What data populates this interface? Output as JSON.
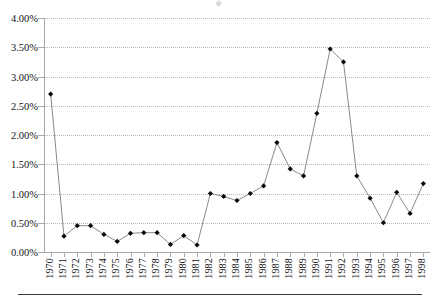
{
  "chart_data": {
    "type": "line",
    "title": "",
    "subtitle": "",
    "xlabel": "",
    "ylabel": "",
    "ylim": [
      0,
      4
    ],
    "y_tick_step": 0.5,
    "y_tick_labels": [
      "0.00%",
      "0.50%",
      "1.00%",
      "1.50%",
      "2.00%",
      "2.50%",
      "3.00%",
      "3.50%",
      "4.00%"
    ],
    "y_tick_values": [
      0,
      0.5,
      1.0,
      1.5,
      2.0,
      2.5,
      3.0,
      3.5,
      4.0
    ],
    "grid": true,
    "grid_axis": "y",
    "grid_style": "dotted",
    "legend": "none",
    "units": "percent",
    "categories": [
      "1970",
      "1971",
      "1972",
      "1973",
      "1974",
      "1975",
      "1976",
      "1977",
      "1978",
      "1979",
      "1980",
      "1981",
      "1982",
      "1983",
      "1984",
      "1985",
      "1986",
      "1987",
      "1988",
      "1989",
      "1990",
      "1991",
      "1992",
      "1993",
      "1994",
      "1995",
      "1996",
      "1997",
      "1998"
    ],
    "x_tick_labels": [
      "1970",
      "1971",
      "1972",
      "1973",
      "1974",
      "1975",
      "1976",
      "1977",
      "1978",
      "1979",
      "1980",
      "1981",
      "1982",
      "1983",
      "1984",
      "1985",
      "1986",
      "1987",
      "1988",
      "1989",
      "1990",
      "1991",
      "1992",
      "1993",
      "1994",
      "1995",
      "1996",
      "1997",
      "1998"
    ],
    "x_tick_rotation": 90,
    "values": [
      2.7,
      0.27,
      0.45,
      0.45,
      0.3,
      0.18,
      0.32,
      0.33,
      0.33,
      0.13,
      0.28,
      0.12,
      1.0,
      0.95,
      0.88,
      1.0,
      1.13,
      1.87,
      1.42,
      1.3,
      2.37,
      3.47,
      3.25,
      1.3,
      0.92,
      0.5,
      1.02,
      0.66,
      1.17
    ],
    "series": [
      {
        "name": "Series 1",
        "marker": "diamond",
        "marker_color": "#0a0a0a",
        "line_color": "#8a8a8a",
        "values": [
          2.7,
          0.27,
          0.45,
          0.45,
          0.3,
          0.18,
          0.32,
          0.33,
          0.33,
          0.13,
          0.28,
          0.12,
          1.0,
          0.95,
          0.88,
          1.0,
          1.13,
          1.87,
          1.42,
          1.3,
          2.37,
          3.47,
          3.25,
          1.3,
          0.92,
          0.5,
          1.02,
          0.66,
          1.17
        ]
      }
    ],
    "points": [
      {
        "x": "1970",
        "y": 2.7
      },
      {
        "x": "1971",
        "y": 0.27
      },
      {
        "x": "1972",
        "y": 0.45
      },
      {
        "x": "1973",
        "y": 0.45
      },
      {
        "x": "1974",
        "y": 0.3
      },
      {
        "x": "1975",
        "y": 0.18
      },
      {
        "x": "1976",
        "y": 0.32
      },
      {
        "x": "1977",
        "y": 0.33
      },
      {
        "x": "1978",
        "y": 0.33
      },
      {
        "x": "1979",
        "y": 0.13
      },
      {
        "x": "1980",
        "y": 0.28
      },
      {
        "x": "1981",
        "y": 0.12
      },
      {
        "x": "1982",
        "y": 1.0
      },
      {
        "x": "1983",
        "y": 0.95
      },
      {
        "x": "1984",
        "y": 0.88
      },
      {
        "x": "1985",
        "y": 1.0
      },
      {
        "x": "1986",
        "y": 1.13
      },
      {
        "x": "1987",
        "y": 1.87
      },
      {
        "x": "1988",
        "y": 1.42
      },
      {
        "x": "1989",
        "y": 1.3
      },
      {
        "x": "1990",
        "y": 2.37
      },
      {
        "x": "1991",
        "y": 3.47
      },
      {
        "x": "1992",
        "y": 3.25
      },
      {
        "x": "1993",
        "y": 1.3
      },
      {
        "x": "1994",
        "y": 0.92
      },
      {
        "x": "1995",
        "y": 0.5
      },
      {
        "x": "1996",
        "y": 1.02
      },
      {
        "x": "1997",
        "y": 0.66
      },
      {
        "x": "1998",
        "y": 1.17
      }
    ]
  },
  "colors": {
    "line": "#8a8a8a",
    "marker": "#0a0a0a",
    "grid": "#b9b9c4",
    "axis": "#a8a8ae",
    "text": "#141414",
    "rule": "#3b3b3b",
    "background": "#ffffff"
  }
}
